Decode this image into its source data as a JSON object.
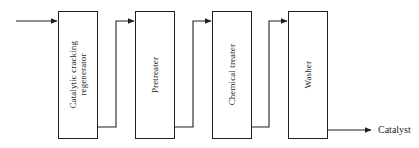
{
  "diagram": {
    "type": "block-flow-diagram",
    "colors": {
      "line": "#231f20",
      "box_fill": "#ffffff",
      "background": "#ffffff",
      "text": "#231f20"
    },
    "units": [
      {
        "id": "catalytic-cracking-regenerator",
        "label": "Catalytic cracking\nregenerator",
        "orientation": "vertical-text",
        "x": 58,
        "y": 11,
        "width": 40,
        "height": 128
      },
      {
        "id": "pretreater",
        "label": "Pretreater",
        "orientation": "vertical-text",
        "x": 135,
        "y": 11,
        "width": 40,
        "height": 128
      },
      {
        "id": "chemical-treater",
        "label": "Chemical treater",
        "orientation": "vertical-text",
        "x": 212,
        "y": 11,
        "width": 40,
        "height": 128
      },
      {
        "id": "washer",
        "label": "Washer",
        "orientation": "vertical-text",
        "x": 288,
        "y": 11,
        "width": 40,
        "height": 128
      }
    ],
    "streams": [
      {
        "id": "feed-inlet",
        "label": "",
        "from": "external",
        "to": "catalytic-cracking-regenerator",
        "kind": "straight-arrow"
      },
      {
        "id": "regenerator-to-pretreater",
        "label": "",
        "from": "catalytic-cracking-regenerator",
        "to": "pretreater",
        "kind": "elbow-arrow"
      },
      {
        "id": "pretreater-to-chemical-treater",
        "label": "",
        "from": "pretreater",
        "to": "chemical-treater",
        "kind": "elbow-arrow"
      },
      {
        "id": "chemical-treater-to-washer",
        "label": "",
        "from": "chemical-treater",
        "to": "washer",
        "kind": "elbow-arrow"
      },
      {
        "id": "catalyst-outlet",
        "label": "Catalyst",
        "from": "washer",
        "to": "external",
        "kind": "straight-arrow"
      }
    ],
    "output_label": "Catalyst"
  }
}
